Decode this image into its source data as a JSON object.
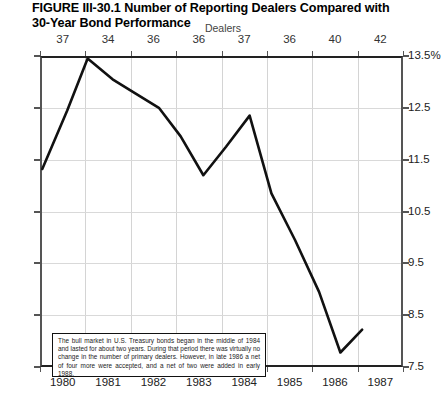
{
  "figure": {
    "title_line1": "FIGURE III-30.1  Number of Reporting Dealers Compared with",
    "title_line2": "30-Year Bond Performance"
  },
  "annotation": {
    "text": "The bull market in U.S. Treasury bonds began in the middle of 1984 and lasted for about two years. During that period there was virtually no change in the number of primary dealers. However, in late 1986 a net of four more were accepted, and a net of two were added in early 1988."
  },
  "chart_data": {
    "type": "line",
    "title": "FIGURE III-30.1  Number of Reporting Dealers Compared with 30-Year Bond Performance",
    "xlabel": "",
    "ylabel": "",
    "top_axis_label": "Dealers",
    "grid": true,
    "legend": false,
    "ylim": [
      7.5,
      13.5
    ],
    "y_ticks": [
      "13.5%",
      "12.5",
      "11.5",
      "10.5",
      "9.5",
      "8.5",
      "7.5"
    ],
    "y_tick_values": [
      13.5,
      12.5,
      11.5,
      10.5,
      9.5,
      8.5,
      7.5
    ],
    "y_ticks_right": [
      "13.5%",
      "12.5",
      "11.5",
      "10.5",
      "9.5",
      "8.5",
      "7.5"
    ],
    "categories": [
      "1980",
      "1981",
      "1982",
      "1983",
      "1984",
      "1985",
      "1986",
      "1987"
    ],
    "top_categories": [
      "37",
      "34",
      "36",
      "36",
      "37",
      "36",
      "40",
      "42"
    ],
    "series": [
      {
        "name": "30-Year Bond Yield",
        "color": "#111111",
        "x": [
          1980.05,
          1980.6,
          1981.05,
          1981.6,
          1982.1,
          1982.62,
          1983.1,
          1983.6,
          1984.1,
          1984.62,
          1985.1,
          1985.62,
          1986.15,
          1986.62,
          1987.1
        ],
        "values": [
          11.32,
          12.45,
          13.45,
          13.05,
          12.78,
          12.5,
          11.95,
          11.2,
          11.75,
          12.35,
          10.85,
          9.95,
          8.95,
          7.78,
          8.22
        ]
      }
    ],
    "dealer_counts": [
      {
        "year": "1980",
        "count": 37
      },
      {
        "year": "1981",
        "count": 34
      },
      {
        "year": "1982",
        "count": 36
      },
      {
        "year": "1983",
        "count": 36
      },
      {
        "year": "1984",
        "count": 37
      },
      {
        "year": "1985",
        "count": 36
      },
      {
        "year": "1986",
        "count": 40
      },
      {
        "year": "1987",
        "count": 42
      }
    ]
  }
}
